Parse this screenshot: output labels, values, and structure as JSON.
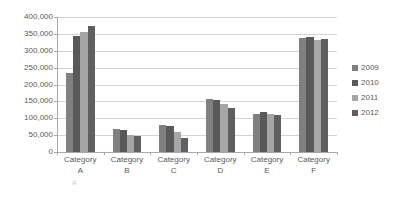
{
  "chart_data": {
    "type": "bar",
    "title": "",
    "xlabel": "",
    "ylabel": "",
    "ylim": [
      0,
      400000
    ],
    "ytick_interval": 50000,
    "grid": true,
    "legend_position": "right",
    "categories": [
      "Category A",
      "Category B",
      "Category C",
      "Category D",
      "Category E",
      "Category F"
    ],
    "category_lines": [
      [
        "Category",
        "A"
      ],
      [
        "Category",
        "B"
      ],
      [
        "Category",
        "C"
      ],
      [
        "Category",
        "D"
      ],
      [
        "Category",
        "E"
      ],
      [
        "Category",
        "F"
      ]
    ],
    "ytick_labels": [
      "400,000",
      "350,000",
      "300,000",
      "250,000",
      "200,000",
      "150,000",
      "100,000",
      "50,000",
      "0"
    ],
    "ytick_values": [
      400000,
      350000,
      300000,
      250000,
      200000,
      150000,
      100000,
      50000,
      0
    ],
    "series": [
      {
        "name": "2009",
        "color": "#808080",
        "values": [
          233000,
          68000,
          80000,
          156000,
          112000,
          338000
        ]
      },
      {
        "name": "2010",
        "color": "#595959",
        "values": [
          343000,
          64000,
          77000,
          155000,
          118000,
          341000
        ]
      },
      {
        "name": "2011",
        "color": "#a6a6a6",
        "values": [
          355000,
          50000,
          60000,
          141000,
          112000,
          331000
        ]
      },
      {
        "name": "2012",
        "color": "#5f5f5f",
        "values": [
          372000,
          47000,
          42000,
          130000,
          111000,
          335000
        ]
      }
    ]
  },
  "legend": {
    "items": [
      {
        "label": "2009",
        "color": "#808080"
      },
      {
        "label": "2010",
        "color": "#595959"
      },
      {
        "label": "2011",
        "color": "#a6a6a6"
      },
      {
        "label": "2012",
        "color": "#5f5f5f"
      }
    ]
  },
  "artifact": {
    "bottom_text": "",
    "glyph": "A"
  }
}
